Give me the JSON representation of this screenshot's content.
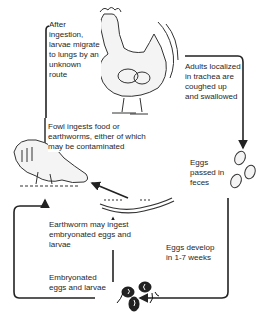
{
  "diagram": {
    "type": "life-cycle",
    "steps": [
      {
        "id": "migrate",
        "text": "After ingestion, larvae migrate to lungs by an unknown route"
      },
      {
        "id": "adults",
        "text": "Adults localized in trachea are coughed up and swallowed"
      },
      {
        "id": "fowl-ingests",
        "text": "Fowl ingests food or earthworms, either of which may be contaminated"
      },
      {
        "id": "eggs-passed",
        "text": "Eggs passed in feces"
      },
      {
        "id": "earthworm",
        "text": "Earthworm may ingest embryonated eggs and larvae"
      },
      {
        "id": "eggs-develop",
        "text": "Eggs develop in 1-7 weeks"
      },
      {
        "id": "embryonated",
        "text": "Embryonated eggs and larvae"
      }
    ],
    "illustrations": [
      "rooster",
      "feeding-hen",
      "earthworm",
      "eggs",
      "embryonated-eggs-and-larvae"
    ]
  }
}
